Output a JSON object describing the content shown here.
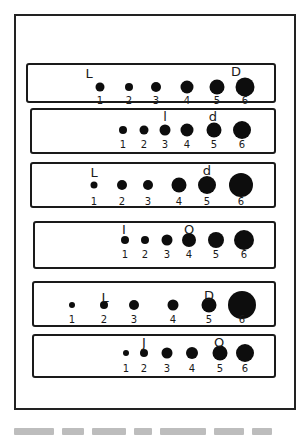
{
  "figure": {
    "strips": [
      {
        "box": {
          "left": 26,
          "top": 63,
          "width": 250,
          "height": 40
        },
        "dots": [
          {
            "label": "1",
            "x": 98,
            "size": 9
          },
          {
            "label": "2",
            "x": 127,
            "size": 8
          },
          {
            "label": "3",
            "x": 154,
            "size": 10
          },
          {
            "label": "4",
            "x": 185,
            "size": 13
          },
          {
            "label": "5",
            "x": 215,
            "size": 15
          },
          {
            "label": "6",
            "x": 243,
            "size": 19
          }
        ],
        "dot_y": 22,
        "num_y": 31,
        "markers": [
          {
            "text": "L",
            "x": 87,
            "y": 2
          },
          {
            "text": "D",
            "x": 234,
            "y": 0
          }
        ]
      },
      {
        "box": {
          "left": 30,
          "top": 108,
          "width": 246,
          "height": 46
        },
        "dots": [
          {
            "label": "1",
            "x": 121,
            "size": 8
          },
          {
            "label": "2",
            "x": 142,
            "size": 9
          },
          {
            "label": "3",
            "x": 163,
            "size": 11
          },
          {
            "label": "4",
            "x": 185,
            "size": 13
          },
          {
            "label": "5",
            "x": 212,
            "size": 15
          },
          {
            "label": "6",
            "x": 240,
            "size": 18
          }
        ],
        "dot_y": 20,
        "num_y": 30,
        "markers": [
          {
            "text": "l",
            "x": 163,
            "y": 0
          },
          {
            "text": "d",
            "x": 211,
            "y": 0
          }
        ]
      },
      {
        "box": {
          "left": 30,
          "top": 162,
          "width": 246,
          "height": 46
        },
        "dots": [
          {
            "label": "1",
            "x": 92,
            "size": 7
          },
          {
            "label": "2",
            "x": 120,
            "size": 10
          },
          {
            "label": "3",
            "x": 146,
            "size": 10
          },
          {
            "label": "4",
            "x": 177,
            "size": 15
          },
          {
            "label": "5",
            "x": 205,
            "size": 18
          },
          {
            "label": "6",
            "x": 239,
            "size": 24
          }
        ],
        "dot_y": 21,
        "num_y": 33,
        "markers": [
          {
            "text": "L",
            "x": 92,
            "y": 2
          },
          {
            "text": "d",
            "x": 205,
            "y": 0
          }
        ]
      },
      {
        "box": {
          "left": 33,
          "top": 221,
          "width": 243,
          "height": 48
        },
        "dots": [
          {
            "label": "1",
            "x": 123,
            "size": 8
          },
          {
            "label": "2",
            "x": 143,
            "size": 8
          },
          {
            "label": "3",
            "x": 165,
            "size": 11
          },
          {
            "label": "4",
            "x": 187,
            "size": 14
          },
          {
            "label": "5",
            "x": 214,
            "size": 16
          },
          {
            "label": "6",
            "x": 242,
            "size": 20
          }
        ],
        "dot_y": 17,
        "num_y": 27,
        "markers": [
          {
            "text": "I",
            "x": 122,
            "y": 0
          },
          {
            "text": "O",
            "x": 187,
            "y": 0
          }
        ]
      },
      {
        "box": {
          "left": 32,
          "top": 281,
          "width": 244,
          "height": 46
        },
        "dots": [
          {
            "label": "1",
            "x": 70,
            "size": 6
          },
          {
            "label": "2",
            "x": 102,
            "size": 8
          },
          {
            "label": "3",
            "x": 132,
            "size": 10
          },
          {
            "label": "4",
            "x": 171,
            "size": 11
          },
          {
            "label": "5",
            "x": 207,
            "size": 15
          },
          {
            "label": "6",
            "x": 240,
            "size": 28
          }
        ],
        "dot_y": 22,
        "num_y": 32,
        "markers": [
          {
            "text": "L",
            "x": 103,
            "y": 8
          },
          {
            "text": "D",
            "x": 207,
            "y": 6
          }
        ]
      },
      {
        "box": {
          "left": 32,
          "top": 334,
          "width": 244,
          "height": 44
        },
        "dots": [
          {
            "label": "1",
            "x": 124,
            "size": 6
          },
          {
            "label": "2",
            "x": 142,
            "size": 8
          },
          {
            "label": "3",
            "x": 165,
            "size": 11
          },
          {
            "label": "4",
            "x": 190,
            "size": 12
          },
          {
            "label": "5",
            "x": 218,
            "size": 15
          },
          {
            "label": "6",
            "x": 243,
            "size": 18
          }
        ],
        "dot_y": 17,
        "num_y": 28,
        "markers": [
          {
            "text": "J",
            "x": 142,
            "y": 0
          },
          {
            "text": "O",
            "x": 217,
            "y": 0
          }
        ]
      }
    ],
    "caption_illegible_word_widths": [
      40,
      22,
      34,
      18,
      46,
      30,
      20
    ]
  }
}
